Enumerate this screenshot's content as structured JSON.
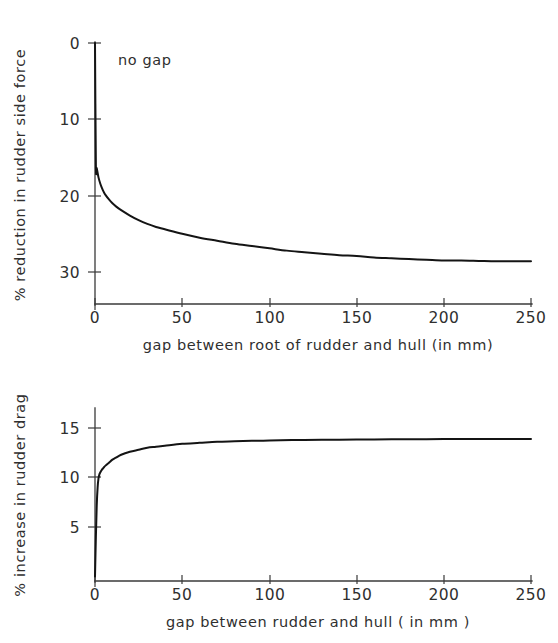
{
  "page": {
    "background": "#ffffff",
    "ink": "#141414",
    "width": 558,
    "height": 643
  },
  "top_chart": {
    "annotation": "no gap",
    "xlabel": "gap between root of rudder and hull  (in mm)",
    "ylabel": "% reduction in rudder side force",
    "x_ticks": [
      "0",
      "50",
      "100",
      "150",
      "200",
      "250"
    ],
    "y_ticks": [
      "0",
      "10",
      "20",
      "30"
    ]
  },
  "bottom_chart": {
    "xlabel": "gap  between rudder and hull  ( in mm )",
    "ylabel": "% increase in rudder drag",
    "x_ticks": [
      "0",
      "50",
      "100",
      "150",
      "200",
      "250"
    ],
    "y_ticks": [
      "15",
      "10",
      "5"
    ]
  },
  "chart_data": [
    {
      "id": "rudder-side-force-reduction",
      "type": "line",
      "title": "",
      "xlabel": "gap between root of rudder and hull  (in mm)",
      "ylabel": "% reduction in rudder side force",
      "xlim": [
        0,
        250
      ],
      "ylim": [
        0,
        32
      ],
      "y_inverted": true,
      "grid": false,
      "legend": null,
      "xticks": [
        0,
        50,
        100,
        150,
        200,
        250
      ],
      "yticks": [
        0,
        10,
        20,
        30
      ],
      "annotations": [
        {
          "text": "no gap",
          "x": 12,
          "y": 3.2
        }
      ],
      "series": [
        {
          "name": "% reduction in rudder side force",
          "x": [
            0,
            0.5,
            1,
            2,
            3,
            4,
            5,
            6,
            8,
            10,
            12,
            15,
            20,
            25,
            30,
            35,
            40,
            50,
            60,
            70,
            80,
            90,
            100,
            110,
            120,
            130,
            140,
            150,
            160,
            170,
            180,
            190,
            200,
            210,
            220,
            230,
            240,
            250
          ],
          "values": [
            0,
            15.9,
            16.4,
            17.6,
            18.4,
            19.0,
            19.5,
            19.9,
            20.5,
            21.0,
            21.4,
            21.9,
            22.6,
            23.2,
            23.7,
            24.1,
            24.4,
            25.0,
            25.5,
            25.9,
            26.3,
            26.6,
            26.9,
            27.2,
            27.4,
            27.6,
            27.8,
            27.9,
            28.1,
            28.2,
            28.3,
            28.4,
            28.5,
            28.5,
            28.55,
            28.6,
            28.6,
            28.6
          ]
        }
      ]
    },
    {
      "id": "rudder-drag-increase",
      "type": "line",
      "title": "",
      "xlabel": "gap  between rudder and hull  ( in mm )",
      "ylabel": "% increase in rudder drag",
      "xlim": [
        0,
        250
      ],
      "ylim": [
        0,
        16.5
      ],
      "y_inverted": false,
      "grid": false,
      "legend": null,
      "xticks": [
        0,
        50,
        100,
        150,
        200,
        250
      ],
      "yticks": [
        5,
        10,
        15
      ],
      "annotations": [],
      "series": [
        {
          "name": "% increase in rudder drag",
          "x": [
            0,
            0.5,
            1,
            1.5,
            2,
            2.5,
            3,
            4,
            5,
            6,
            8,
            10,
            12,
            15,
            20,
            25,
            30,
            35,
            40,
            50,
            60,
            70,
            80,
            90,
            100,
            120,
            140,
            160,
            180,
            200,
            220,
            240,
            250
          ],
          "values": [
            0,
            4.0,
            7.2,
            9.0,
            9.9,
            10.3,
            10.5,
            10.8,
            11.0,
            11.2,
            11.5,
            11.8,
            12.0,
            12.3,
            12.6,
            12.8,
            13.0,
            13.1,
            13.2,
            13.4,
            13.5,
            13.6,
            13.65,
            13.7,
            13.75,
            13.8,
            13.82,
            13.85,
            13.87,
            13.88,
            13.9,
            13.9,
            13.9
          ]
        }
      ]
    }
  ]
}
